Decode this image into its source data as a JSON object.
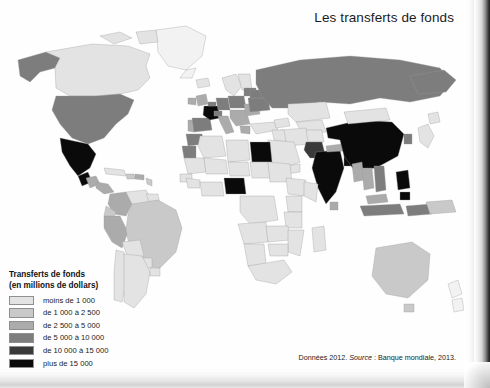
{
  "title": "Les transferts de fonds",
  "source": {
    "prefix": "Données 2012. ",
    "italic": "Source",
    "suffix": " : Banque mondiale, 2013."
  },
  "legend": {
    "title": "Transferts de fonds",
    "subtitle": "(en millions de dollars)",
    "items": [
      {
        "label": "moins de 1 000",
        "color": "#e3e3e3"
      },
      {
        "label": "de 1 000 à 2 500",
        "color": "#c9c9c9"
      },
      {
        "label": "de 2 500 à 5 000",
        "color": "#ababab"
      },
      {
        "label": "de 5 000 à 10 000",
        "color": "#7d7d7d"
      },
      {
        "label": "de 10 000 à 15 000",
        "color": "#3a3a3a"
      },
      {
        "label": "plus de 15 000",
        "color": "#0a0a0a"
      },
      {
        "label": "données non\ndisponibles",
        "color": "#f2f2f2"
      }
    ]
  },
  "chart_data": {
    "type": "map",
    "title": "Les transferts de fonds",
    "unit": "millions de dollars",
    "year": 2012,
    "source": "Banque mondiale, 2013.",
    "projection": "equirectangular-style world choropleth",
    "classes": [
      {
        "label": "moins de 1 000",
        "min": 0,
        "max": 1000,
        "color": "#e3e3e3"
      },
      {
        "label": "de 1 000 à 2 500",
        "min": 1000,
        "max": 2500,
        "color": "#c9c9c9"
      },
      {
        "label": "de 2 500 à 5 000",
        "min": 2500,
        "max": 5000,
        "color": "#ababab"
      },
      {
        "label": "de 5 000 à 10 000",
        "min": 5000,
        "max": 10000,
        "color": "#7d7d7d"
      },
      {
        "label": "de 10 000 à 15 000",
        "min": 10000,
        "max": 15000,
        "color": "#3a3a3a"
      },
      {
        "label": "plus de 15 000",
        "min": 15000,
        "max": null,
        "color": "#0a0a0a"
      },
      {
        "label": "données non disponibles",
        "min": null,
        "max": null,
        "color": "#f2f2f2"
      }
    ],
    "regions": [
      {
        "name": "Canada",
        "class": "moins de 1 000",
        "color": "#e3e3e3"
      },
      {
        "name": "Groenland",
        "class": "données non disponibles",
        "color": "#f2f2f2"
      },
      {
        "name": "Alaska",
        "class": "de 5 000 à 10 000",
        "color": "#7d7d7d"
      },
      {
        "name": "États-Unis",
        "class": "de 5 000 à 10 000",
        "color": "#7d7d7d"
      },
      {
        "name": "Mexique",
        "class": "plus de 15 000",
        "color": "#0a0a0a"
      },
      {
        "name": "Guatemala",
        "class": "de 2 500 à 5 000",
        "color": "#ababab"
      },
      {
        "name": "Cuba",
        "class": "moins de 1 000",
        "color": "#e3e3e3"
      },
      {
        "name": "Haïti",
        "class": "de 1 000 à 2 500",
        "color": "#c9c9c9"
      },
      {
        "name": "Rép. dominicaine",
        "class": "de 2 500 à 5 000",
        "color": "#ababab"
      },
      {
        "name": "Colombie",
        "class": "de 2 500 à 5 000",
        "color": "#ababab"
      },
      {
        "name": "Venezuela",
        "class": "moins de 1 000",
        "color": "#e3e3e3"
      },
      {
        "name": "Équateur",
        "class": "de 1 000 à 2 500",
        "color": "#c9c9c9"
      },
      {
        "name": "Pérou",
        "class": "de 2 500 à 5 000",
        "color": "#ababab"
      },
      {
        "name": "Brésil",
        "class": "de 1 000 à 2 500",
        "color": "#c9c9c9"
      },
      {
        "name": "Bolivie",
        "class": "moins de 1 000",
        "color": "#e3e3e3"
      },
      {
        "name": "Argentine",
        "class": "moins de 1 000",
        "color": "#e3e3e3"
      },
      {
        "name": "Chili",
        "class": "moins de 1 000",
        "color": "#e3e3e3"
      },
      {
        "name": "Maroc",
        "class": "de 5 000 à 10 000",
        "color": "#7d7d7d"
      },
      {
        "name": "Algérie",
        "class": "moins de 1 000",
        "color": "#e3e3e3"
      },
      {
        "name": "Égypte",
        "class": "plus de 15 000",
        "color": "#0a0a0a"
      },
      {
        "name": "Nigeria",
        "class": "plus de 15 000",
        "color": "#0a0a0a"
      },
      {
        "name": "Afrique du Sud",
        "class": "moins de 1 000",
        "color": "#e3e3e3"
      },
      {
        "name": "Sahara/Sahel",
        "class": "moins de 1 000",
        "color": "#e3e3e3"
      },
      {
        "name": "France",
        "class": "plus de 15 000",
        "color": "#0a0a0a"
      },
      {
        "name": "Espagne",
        "class": "de 5 000 à 10 000",
        "color": "#7d7d7d"
      },
      {
        "name": "Portugal",
        "class": "de 2 500 à 5 000",
        "color": "#ababab"
      },
      {
        "name": "Royaume-Uni",
        "class": "de 2 500 à 5 000",
        "color": "#ababab"
      },
      {
        "name": "Allemagne",
        "class": "de 5 000 à 10 000",
        "color": "#7d7d7d"
      },
      {
        "name": "Italie",
        "class": "de 2 500 à 5 000",
        "color": "#ababab"
      },
      {
        "name": "Pologne",
        "class": "de 5 000 à 10 000",
        "color": "#7d7d7d"
      },
      {
        "name": "Roumanie",
        "class": "de 2 500 à 5 000",
        "color": "#ababab"
      },
      {
        "name": "Ukraine",
        "class": "de 5 000 à 10 000",
        "color": "#7d7d7d"
      },
      {
        "name": "Russie",
        "class": "de 5 000 à 10 000",
        "color": "#7d7d7d"
      },
      {
        "name": "Turquie",
        "class": "moins de 1 000",
        "color": "#e3e3e3"
      },
      {
        "name": "Arabie saoudite",
        "class": "moins de 1 000",
        "color": "#e3e3e3"
      },
      {
        "name": "Kazakhstan",
        "class": "moins de 1 000",
        "color": "#e3e3e3"
      },
      {
        "name": "Pakistan",
        "class": "de 10 000 à 15 000",
        "color": "#3a3a3a"
      },
      {
        "name": "Inde",
        "class": "plus de 15 000",
        "color": "#0a0a0a"
      },
      {
        "name": "Bangladesh",
        "class": "plus de 15 000",
        "color": "#0a0a0a"
      },
      {
        "name": "Népal",
        "class": "de 2 500 à 5 000",
        "color": "#ababab"
      },
      {
        "name": "Chine",
        "class": "plus de 15 000",
        "color": "#0a0a0a"
      },
      {
        "name": "Mongolie",
        "class": "moins de 1 000",
        "color": "#e3e3e3"
      },
      {
        "name": "Japon",
        "class": "moins de 1 000",
        "color": "#e3e3e3"
      },
      {
        "name": "Corée du Sud",
        "class": "de 5 000 à 10 000",
        "color": "#7d7d7d"
      },
      {
        "name": "Viêt Nam",
        "class": "de 5 000 à 10 000",
        "color": "#7d7d7d"
      },
      {
        "name": "Thaïlande",
        "class": "de 2 500 à 5 000",
        "color": "#ababab"
      },
      {
        "name": "Philippines",
        "class": "plus de 15 000",
        "color": "#0a0a0a"
      },
      {
        "name": "Indonésie",
        "class": "de 5 000 à 10 000",
        "color": "#7d7d7d"
      },
      {
        "name": "Australie",
        "class": "de 1 000 à 2 500",
        "color": "#c9c9c9"
      },
      {
        "name": "Nouvelle-Zélande",
        "class": "données non disponibles",
        "color": "#f2f2f2"
      }
    ]
  }
}
